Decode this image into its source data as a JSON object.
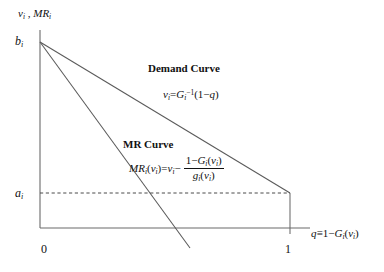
{
  "figure": {
    "type": "economics-diagram",
    "background_color": "#ffffff",
    "line_color": "#555555",
    "text_color": "#111111"
  },
  "axes": {
    "y_label": "v_i , MR_i",
    "y_label_parts": {
      "v": "v",
      "v_sub": "i",
      "sep": " , ",
      "mr": "MR",
      "mr_sub": "i"
    },
    "x_label": "q ≡ 1 − G_i(v_i)",
    "x_label_parts": {
      "q": "q",
      "equiv": "≡",
      "one": "1",
      "minus": "−",
      "G": "G",
      "G_sub": "i",
      "open": "(",
      "v": "v",
      "v_sub": "i",
      "close": ")"
    },
    "y_ticks": [
      {
        "label": "b",
        "sub": "i",
        "value_name": "b_i",
        "y_px": 42
      },
      {
        "label": "a",
        "sub": "i",
        "value_name": "a_i",
        "y_px": 193
      }
    ],
    "x_ticks": [
      {
        "label": "0",
        "value": 0,
        "x_px": 46
      },
      {
        "label": "1",
        "value": 1,
        "x_px": 290
      }
    ],
    "origin_px": {
      "x": 40,
      "y": 228
    },
    "y_axis_top_px": 30,
    "x_axis_right_px": 310
  },
  "curves": [
    {
      "name": "Demand Curve",
      "label": "Demand Curve",
      "equation_text": "v_i = G_i^{-1}(1 - q)",
      "equation_parts": {
        "v": "v",
        "v_sub": "i",
        "eq": "=",
        "G": "G",
        "G_sub": "i",
        "G_sup": "−1",
        "open": "(",
        "one": "1",
        "minus": "−",
        "q": "q",
        "close": ")"
      },
      "from_px": {
        "x": 40,
        "y": 42
      },
      "to_px": {
        "x": 290,
        "y": 193
      },
      "style": "solid"
    },
    {
      "name": "MR Curve",
      "label": "MR Curve",
      "equation_text": "MR_i(v_i) = v_i - (1 - G_i(v_i)) / g_i(v_i)",
      "equation_parts": {
        "MR": "MR",
        "MR_sub": "i",
        "open1": "(",
        "v1": "v",
        "v1_sub": "i",
        "close1": ")",
        "eq": "=",
        "v2": "v",
        "v2_sub": "i",
        "minus": "−",
        "num_one": "1",
        "num_minus": "−",
        "num_G": "G",
        "num_G_sub": "i",
        "num_open": "(",
        "num_v": "v",
        "num_v_sub": "i",
        "num_close": ")",
        "den_g": "g",
        "den_g_sub": "i",
        "den_open": "(",
        "den_v": "v",
        "den_v_sub": "i",
        "den_close": ")"
      },
      "from_px": {
        "x": 40,
        "y": 42
      },
      "to_px": {
        "x": 190,
        "y": 248
      },
      "style": "solid"
    }
  ],
  "guides": [
    {
      "name": "a_i horizontal guide",
      "style": "dashed",
      "from_px": {
        "x": 40,
        "y": 193
      },
      "to_px": {
        "x": 290,
        "y": 193
      }
    },
    {
      "name": "q=1 vertical drop",
      "style": "solid",
      "from_px": {
        "x": 290,
        "y": 193
      },
      "to_px": {
        "x": 290,
        "y": 228
      }
    }
  ]
}
